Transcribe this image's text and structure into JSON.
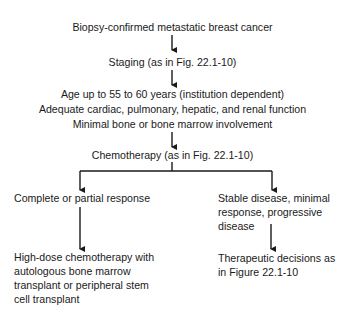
{
  "flowchart": {
    "nodes": {
      "start": "Biopsy-confirmed metastatic breast cancer",
      "staging": "Staging (as in Fig. 22.1-10)",
      "criteria": [
        "Age up to 55 to 60 years (institution dependent)",
        "Adequate cardiac, pulmonary, hepatic, and renal function",
        "Minimal bone or bone marrow involvement"
      ],
      "chemotherapy": "Chemotherapy (as in Fig. 22.1-10)",
      "left_branch": {
        "response": "Complete or partial response",
        "treatment": [
          "High-dose chemotherapy with",
          "autologous bone marrow",
          "transplant or peripheral stem",
          "cell transplant"
        ]
      },
      "right_branch": {
        "response": [
          "Stable disease, minimal",
          "response, progressive",
          "disease"
        ],
        "treatment": [
          "Therapeutic decisions as",
          "in Figure 22.1-10"
        ]
      }
    },
    "colors": {
      "line": "#1a1a1a",
      "text": "#1a1a1a",
      "background": "#ffffff"
    }
  }
}
